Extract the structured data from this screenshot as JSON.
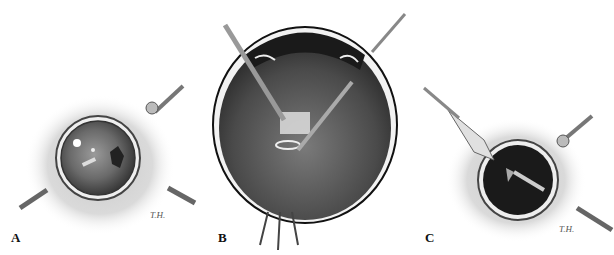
{
  "figure": {
    "panels": [
      {
        "id": "A",
        "label": "A",
        "description": "Surgeon's view through pupil: instruments in vitreous cavity with light reflex",
        "signature": "T.H."
      },
      {
        "id": "B",
        "label": "B",
        "description": "Cross-section of eye with two instruments meeting at retinal lesion near optic nerve"
      },
      {
        "id": "C",
        "label": "C",
        "description": "Surgeon's view through dark pupil with contact lens on left and instrument inside",
        "signature": "T.H."
      }
    ],
    "colors": {
      "background": "#ffffff",
      "ink": "#111111",
      "tissue": "#c8c8c8",
      "globe": "#3a3a3a"
    }
  }
}
